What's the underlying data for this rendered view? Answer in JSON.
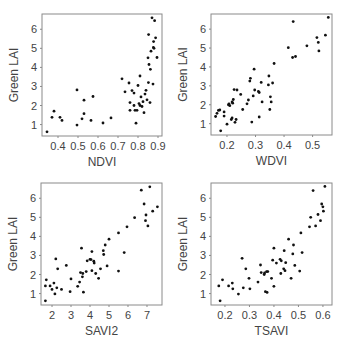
{
  "figure": {
    "width": 345,
    "height": 344,
    "colors": {
      "frame": "#8a8a8a",
      "point": "#111111",
      "text": "#444444",
      "tick": "#8a8a8a"
    }
  },
  "chart_data": [
    {
      "type": "scatter",
      "title": "",
      "xlabel": "NDVI",
      "ylabel": "Green LAI",
      "xlim": [
        0.32,
        0.92
      ],
      "ylim": [
        0.4,
        6.8
      ],
      "xticks": [
        0.4,
        0.5,
        0.6,
        0.7,
        0.8,
        0.9
      ],
      "xtick_labels": [
        "0.4",
        "0.5",
        "0.6",
        "0.7",
        "0.8",
        "0.9"
      ],
      "yticks": [
        1,
        2,
        3,
        4,
        5,
        6
      ],
      "ytick_labels": [
        "1",
        "2",
        "3",
        "4",
        "5",
        "6"
      ],
      "grid": false,
      "frame_px": {
        "left": 42,
        "top": 14,
        "right": 162,
        "bottom": 136
      },
      "points": [
        [
          0.345,
          0.62
        ],
        [
          0.37,
          1.38
        ],
        [
          0.38,
          1.7
        ],
        [
          0.41,
          1.38
        ],
        [
          0.42,
          1.22
        ],
        [
          0.495,
          2.82
        ],
        [
          0.495,
          0.97
        ],
        [
          0.52,
          1.3
        ],
        [
          0.53,
          1.57
        ],
        [
          0.53,
          2.28
        ],
        [
          0.565,
          1.22
        ],
        [
          0.575,
          2.47
        ],
        [
          0.625,
          1.08
        ],
        [
          0.665,
          1.35
        ],
        [
          0.72,
          3.4
        ],
        [
          0.735,
          2.72
        ],
        [
          0.755,
          3.18
        ],
        [
          0.76,
          2.15
        ],
        [
          0.76,
          1.75
        ],
        [
          0.77,
          2.78
        ],
        [
          0.78,
          2.65
        ],
        [
          0.78,
          2.0
        ],
        [
          0.785,
          1.75
        ],
        [
          0.79,
          1.07
        ],
        [
          0.795,
          1.75
        ],
        [
          0.8,
          3.05
        ],
        [
          0.805,
          2.1
        ],
        [
          0.81,
          3.55
        ],
        [
          0.81,
          2.0
        ],
        [
          0.815,
          2.45
        ],
        [
          0.82,
          1.95
        ],
        [
          0.825,
          2.2
        ],
        [
          0.83,
          1.62
        ],
        [
          0.835,
          2.6
        ],
        [
          0.84,
          2.8
        ],
        [
          0.845,
          2.3
        ],
        [
          0.85,
          4.5
        ],
        [
          0.852,
          3.2
        ],
        [
          0.853,
          5.72
        ],
        [
          0.855,
          4.15
        ],
        [
          0.86,
          2.15
        ],
        [
          0.862,
          3.9
        ],
        [
          0.865,
          4.85
        ],
        [
          0.87,
          6.6
        ],
        [
          0.875,
          3.12
        ],
        [
          0.877,
          5.05
        ],
        [
          0.878,
          5.35
        ],
        [
          0.88,
          5.0
        ],
        [
          0.883,
          6.45
        ],
        [
          0.888,
          5.55
        ],
        [
          0.895,
          4.52
        ]
      ]
    },
    {
      "type": "scatter",
      "title": "",
      "xlabel": "WDVI",
      "ylabel": "Green LAI",
      "xlim": [
        0.144,
        0.568
      ],
      "ylim": [
        0.4,
        6.8
      ],
      "xticks": [
        0.2,
        0.3,
        0.4,
        0.5
      ],
      "xtick_labels": [
        "0.2",
        "0.3",
        "0.4",
        "0.5"
      ],
      "yticks": [
        1,
        2,
        3,
        4,
        5,
        6
      ],
      "ytick_labels": [
        "1",
        "2",
        "3",
        "4",
        "5",
        "6"
      ],
      "grid": false,
      "frame_px": {
        "left": 211,
        "top": 14,
        "right": 332,
        "bottom": 135
      },
      "points": [
        [
          0.16,
          1.38
        ],
        [
          0.165,
          1.55
        ],
        [
          0.17,
          1.7
        ],
        [
          0.175,
          1.72
        ],
        [
          0.178,
          0.62
        ],
        [
          0.19,
          1.4
        ],
        [
          0.19,
          1.62
        ],
        [
          0.2,
          0.97
        ],
        [
          0.205,
          2.0
        ],
        [
          0.207,
          2.05
        ],
        [
          0.21,
          1.95
        ],
        [
          0.215,
          1.22
        ],
        [
          0.218,
          2.15
        ],
        [
          0.218,
          1.3
        ],
        [
          0.22,
          2.08
        ],
        [
          0.222,
          2.28
        ],
        [
          0.225,
          2.8
        ],
        [
          0.228,
          1.07
        ],
        [
          0.232,
          1.22
        ],
        [
          0.235,
          2.78
        ],
        [
          0.248,
          2.55
        ],
        [
          0.255,
          1.75
        ],
        [
          0.27,
          2.05
        ],
        [
          0.275,
          2.25
        ],
        [
          0.28,
          3.25
        ],
        [
          0.282,
          3.4
        ],
        [
          0.287,
          1.08
        ],
        [
          0.292,
          2.47
        ],
        [
          0.295,
          3.88
        ],
        [
          0.297,
          2.78
        ],
        [
          0.31,
          2.7
        ],
        [
          0.313,
          2.65
        ],
        [
          0.313,
          1.35
        ],
        [
          0.32,
          3.18
        ],
        [
          0.323,
          2.15
        ],
        [
          0.345,
          3.05
        ],
        [
          0.347,
          3.52
        ],
        [
          0.35,
          1.75
        ],
        [
          0.352,
          2.42
        ],
        [
          0.355,
          2.15
        ],
        [
          0.36,
          3.15
        ],
        [
          0.365,
          4.18
        ],
        [
          0.415,
          5.02
        ],
        [
          0.43,
          4.5
        ],
        [
          0.432,
          6.4
        ],
        [
          0.44,
          4.55
        ],
        [
          0.48,
          5.12
        ],
        [
          0.515,
          5.55
        ],
        [
          0.52,
          5.3
        ],
        [
          0.522,
          4.85
        ],
        [
          0.545,
          5.68
        ],
        [
          0.555,
          6.62
        ]
      ]
    },
    {
      "type": "scatter",
      "title": "",
      "xlabel": "SAVI2",
      "ylabel": "Green LAI",
      "xlim": [
        1.42,
        7.79
      ],
      "ylim": [
        0.4,
        6.8
      ],
      "xticks": [
        2,
        3,
        4,
        5,
        6,
        7
      ],
      "xtick_labels": [
        "2",
        "3",
        "4",
        "5",
        "6",
        "7"
      ],
      "yticks": [
        1,
        2,
        3,
        4,
        5,
        6
      ],
      "ytick_labels": [
        "1",
        "2",
        "3",
        "4",
        "5",
        "6"
      ],
      "grid": false,
      "frame_px": {
        "left": 41,
        "top": 183,
        "right": 162,
        "bottom": 305
      },
      "points": [
        [
          1.65,
          0.62
        ],
        [
          1.65,
          1.4
        ],
        [
          1.7,
          1.72
        ],
        [
          1.9,
          1.4
        ],
        [
          2.0,
          1.22
        ],
        [
          2.1,
          1.55
        ],
        [
          2.15,
          0.98
        ],
        [
          2.2,
          2.82
        ],
        [
          2.25,
          1.3
        ],
        [
          2.3,
          2.3
        ],
        [
          2.5,
          1.22
        ],
        [
          2.75,
          2.48
        ],
        [
          2.95,
          1.1
        ],
        [
          3.0,
          1.77
        ],
        [
          3.35,
          1.38
        ],
        [
          3.45,
          1.6
        ],
        [
          3.5,
          2.1
        ],
        [
          3.55,
          3.38
        ],
        [
          3.6,
          1.88
        ],
        [
          3.62,
          2.05
        ],
        [
          3.65,
          1.07
        ],
        [
          3.8,
          2.15
        ],
        [
          3.85,
          2.72
        ],
        [
          4.0,
          2.8
        ],
        [
          4.05,
          2.78
        ],
        [
          4.1,
          3.2
        ],
        [
          4.1,
          2.2
        ],
        [
          4.2,
          2.7
        ],
        [
          4.22,
          2.6
        ],
        [
          4.3,
          2.05
        ],
        [
          4.45,
          1.8
        ],
        [
          4.55,
          2.3
        ],
        [
          4.7,
          3.25
        ],
        [
          4.72,
          3.05
        ],
        [
          4.8,
          3.55
        ],
        [
          4.9,
          2.45
        ],
        [
          5.0,
          3.85
        ],
        [
          5.5,
          4.18
        ],
        [
          5.5,
          2.18
        ],
        [
          5.8,
          3.15
        ],
        [
          5.95,
          4.5
        ],
        [
          6.35,
          4.98
        ],
        [
          6.7,
          6.42
        ],
        [
          6.85,
          5.7
        ],
        [
          6.92,
          4.82
        ],
        [
          6.95,
          5.12
        ],
        [
          7.05,
          4.55
        ],
        [
          7.15,
          6.6
        ],
        [
          7.3,
          5.32
        ],
        [
          7.55,
          5.55
        ]
      ]
    },
    {
      "type": "scatter",
      "title": "",
      "xlabel": "TSAVI",
      "ylabel": "Green LAI",
      "xlim": [
        0.143,
        0.637
      ],
      "ylim": [
        0.4,
        6.8
      ],
      "xticks": [
        0.2,
        0.3,
        0.4,
        0.5,
        0.6
      ],
      "xtick_labels": [
        "0.2",
        "0.3",
        "0.4",
        "0.5",
        "0.6"
      ],
      "yticks": [
        1,
        2,
        3,
        4,
        5,
        6
      ],
      "ytick_labels": [
        "1",
        "2",
        "3",
        "4",
        "5",
        "6"
      ],
      "grid": false,
      "frame_px": {
        "left": 211,
        "top": 183,
        "right": 332,
        "bottom": 305
      },
      "points": [
        [
          0.175,
          1.4
        ],
        [
          0.18,
          0.62
        ],
        [
          0.19,
          1.72
        ],
        [
          0.215,
          1.4
        ],
        [
          0.23,
          1.55
        ],
        [
          0.232,
          1.25
        ],
        [
          0.255,
          0.97
        ],
        [
          0.27,
          2.85
        ],
        [
          0.275,
          1.3
        ],
        [
          0.285,
          2.3
        ],
        [
          0.298,
          1.8
        ],
        [
          0.302,
          1.25
        ],
        [
          0.335,
          1.6
        ],
        [
          0.345,
          2.5
        ],
        [
          0.348,
          2.1
        ],
        [
          0.36,
          2.0
        ],
        [
          0.362,
          2.08
        ],
        [
          0.365,
          1.1
        ],
        [
          0.37,
          2.15
        ],
        [
          0.372,
          1.06
        ],
        [
          0.375,
          2.15
        ],
        [
          0.39,
          1.8
        ],
        [
          0.395,
          2.75
        ],
        [
          0.4,
          3.38
        ],
        [
          0.4,
          1.38
        ],
        [
          0.41,
          2.6
        ],
        [
          0.425,
          2.8
        ],
        [
          0.428,
          2.05
        ],
        [
          0.43,
          2.72
        ],
        [
          0.44,
          2.3
        ],
        [
          0.442,
          3.25
        ],
        [
          0.445,
          2.2
        ],
        [
          0.448,
          2.62
        ],
        [
          0.46,
          3.85
        ],
        [
          0.47,
          1.8
        ],
        [
          0.477,
          3.08
        ],
        [
          0.48,
          3.55
        ],
        [
          0.485,
          2.48
        ],
        [
          0.505,
          2.18
        ],
        [
          0.51,
          4.18
        ],
        [
          0.515,
          3.15
        ],
        [
          0.545,
          4.5
        ],
        [
          0.55,
          5.0
        ],
        [
          0.56,
          6.4
        ],
        [
          0.57,
          4.55
        ],
        [
          0.58,
          5.15
        ],
        [
          0.59,
          4.82
        ],
        [
          0.595,
          5.7
        ],
        [
          0.6,
          5.55
        ],
        [
          0.602,
          5.32
        ],
        [
          0.608,
          6.62
        ]
      ]
    }
  ]
}
